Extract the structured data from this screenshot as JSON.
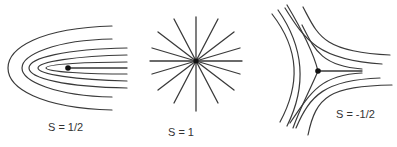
{
  "figure": {
    "panels": [
      {
        "id": "half",
        "label": "S = 1/2",
        "type": "loop singularity (nested parabolic curves with ray)"
      },
      {
        "id": "one",
        "label": "S = 1",
        "type": "star singularity (radial lines)"
      },
      {
        "id": "neg_half",
        "label": "S = -1/2",
        "type": "trisector singularity (three-sector hyperbolic curves)"
      }
    ],
    "colors": {
      "line": "#3a3a3a",
      "dot": "#111111",
      "background": "#ffffff",
      "text": "#333333"
    }
  }
}
